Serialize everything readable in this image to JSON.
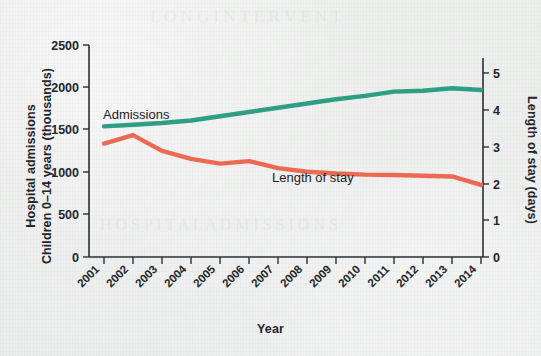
{
  "chart_data": {
    "type": "line",
    "title": "",
    "xlabel": "Year",
    "ylabel": "Hospital admissions\nChildren 0–14 years (thousands)",
    "ylabel_left_line1": "Hospital admissions",
    "ylabel_left_line2": "Children 0–14 years (thousands)",
    "ylabel_right": "Length of stay (days)",
    "x": [
      2001,
      2002,
      2003,
      2004,
      2005,
      2006,
      2007,
      2008,
      2009,
      2010,
      2011,
      2012,
      2013,
      2014
    ],
    "categories": [
      "2001",
      "2002",
      "2003",
      "2004",
      "2005",
      "2006",
      "2007",
      "2008",
      "2009",
      "2010",
      "2011",
      "2012",
      "2013",
      "2014"
    ],
    "ylim": [
      0,
      2500
    ],
    "yticks": [
      0,
      500,
      1000,
      1500,
      2000,
      2500
    ],
    "ytick_labels": [
      "0",
      "500",
      "1000",
      "1500",
      "2000",
      "2500"
    ],
    "y2lim": [
      0,
      5.5
    ],
    "y2ticks": [
      0,
      1,
      2,
      3,
      4,
      5
    ],
    "y2tick_labels": [
      "0",
      "1",
      "2",
      "3",
      "4",
      "5"
    ],
    "grid": false,
    "legend_position": "inline-annotation",
    "series": [
      {
        "name": "Admissions",
        "axis": "left",
        "color": "#2e9e84",
        "unit": "thousands",
        "values": [
          1540,
          1560,
          1580,
          1610,
          1660,
          1710,
          1760,
          1810,
          1860,
          1900,
          1950,
          1960,
          1990,
          1970
        ]
      },
      {
        "name": "Length of stay",
        "axis": "right",
        "color": "#ec6a54",
        "unit": "days",
        "values": [
          3.1,
          3.33,
          2.9,
          2.68,
          2.55,
          2.62,
          2.43,
          2.33,
          2.28,
          2.25,
          2.24,
          2.22,
          2.2,
          1.97
        ]
      }
    ],
    "annotations": [
      {
        "text": "Admissions",
        "series": "Admissions"
      },
      {
        "text": "Length of stay",
        "series": "Length of stay"
      }
    ]
  },
  "colors": {
    "admissions": "#2e9e84",
    "length_of_stay": "#ec6a54",
    "axis": "#2b2f33",
    "text": "#22262b",
    "background": "#eceeec"
  }
}
